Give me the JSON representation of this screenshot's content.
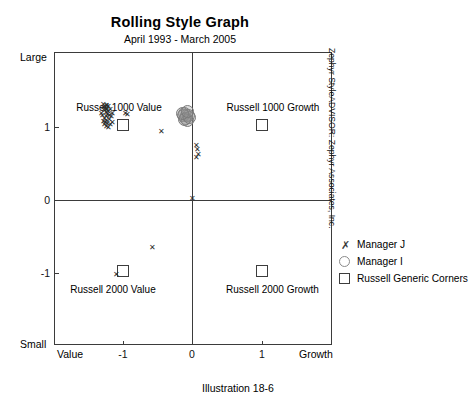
{
  "title": "Rolling Style Graph",
  "subtitle": "April 1993 - March 2005",
  "caption": "Illustration 18-6",
  "credit": "Zephyr StyleADVISOR: Zephyr Associates, Inc.",
  "axis": {
    "y_top_label": "Large",
    "y_bottom_label": "Small",
    "x_left_label": "Value",
    "x_right_label": "Growth",
    "x_ticks": [
      "-1",
      "0",
      "1"
    ],
    "y_ticks": [
      "1",
      "0",
      "-1"
    ]
  },
  "corners": [
    {
      "label": "Russell 1000 Value",
      "x": -1,
      "y": 1
    },
    {
      "label": "Russell 1000 Growth",
      "x": 1,
      "y": 1
    },
    {
      "label": "Russell 2000 Value",
      "x": -1,
      "y": -1
    },
    {
      "label": "Russell 2000 Growth",
      "x": 1,
      "y": -1
    }
  ],
  "legend": [
    {
      "label": "Manager J",
      "marker": "x-icon"
    },
    {
      "label": "Manager I",
      "marker": "circle-icon"
    },
    {
      "label": "Russell Generic Corners",
      "marker": "square-icon"
    }
  ],
  "chart_data": {
    "type": "scatter",
    "title": "Rolling Style Graph",
    "subtitle": "April 1993 - March 2005",
    "xlabel": "Value — Growth",
    "ylabel": "Small — Large",
    "xlim": [
      -1.55,
      1.55
    ],
    "ylim": [
      -1.65,
      1.65
    ],
    "grid": false,
    "legend_position": "right",
    "series": [
      {
        "name": "Manager J",
        "marker": "x",
        "color": "#2a2a2a",
        "points": [
          [
            -1.0,
            1.02
          ],
          [
            -0.99,
            0.99
          ],
          [
            -0.98,
            1.03
          ],
          [
            -0.97,
            0.97
          ],
          [
            -0.96,
            1.0
          ],
          [
            -0.95,
            0.95
          ],
          [
            -0.97,
            0.92
          ],
          [
            -0.99,
            0.9
          ],
          [
            -1.01,
            0.93
          ],
          [
            -1.02,
            0.96
          ],
          [
            -0.94,
            0.98
          ],
          [
            -0.93,
            0.94
          ],
          [
            -0.96,
            0.88
          ],
          [
            -0.98,
            0.86
          ],
          [
            -1.0,
            0.87
          ],
          [
            -0.95,
            0.84
          ],
          [
            -0.93,
            0.89
          ],
          [
            -0.91,
            0.92
          ],
          [
            -0.9,
            0.96
          ],
          [
            -0.92,
            1.0
          ],
          [
            -0.94,
            1.04
          ],
          [
            -0.97,
            1.05
          ],
          [
            -1.0,
            1.06
          ],
          [
            -0.99,
            0.83
          ],
          [
            -0.96,
            0.81
          ],
          [
            -0.94,
            0.8
          ],
          [
            -0.92,
            0.83
          ],
          [
            -0.9,
            0.86
          ],
          [
            -0.75,
            0.96
          ],
          [
            -0.73,
            0.95
          ],
          [
            -0.35,
            0.76
          ],
          [
            0.04,
            0.6
          ],
          [
            0.05,
            0.55
          ],
          [
            0.06,
            0.5
          ],
          [
            0.04,
            0.46
          ],
          [
            -0.01,
            0.0
          ],
          [
            -0.45,
            -0.55
          ],
          [
            -0.85,
            -0.86
          ]
        ]
      },
      {
        "name": "Manager I",
        "marker": "circle",
        "color": "#8a8a8a",
        "points": [
          [
            -0.09,
            0.96
          ],
          [
            -0.07,
            0.94
          ],
          [
            -0.05,
            0.93
          ],
          [
            -0.11,
            0.93
          ],
          [
            -0.08,
            0.9
          ],
          [
            -0.06,
            0.88
          ],
          [
            -0.1,
            0.89
          ],
          [
            -0.04,
            0.91
          ],
          [
            -0.12,
            0.96
          ],
          [
            -0.06,
            0.98
          ]
        ]
      },
      {
        "name": "Russell Generic Corners",
        "marker": "square",
        "color": "#3d3d3d",
        "points": [
          [
            -1,
            1
          ],
          [
            1,
            1
          ],
          [
            -1,
            -1
          ],
          [
            1,
            -1
          ]
        ]
      }
    ]
  }
}
